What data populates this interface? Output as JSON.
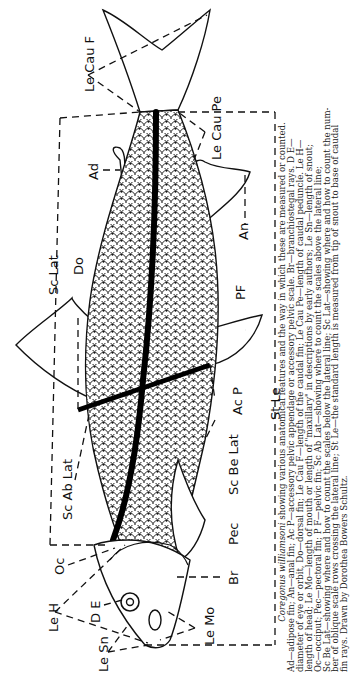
{
  "figure": {
    "subject": "Coregonus williamsoni",
    "orientation": "rotated 90° counter-clockwise (head at bottom, tail at top)",
    "labels": {
      "le_cau_f": "Le Cau F",
      "le_cau_pe": "Le Cau Pe",
      "ad": "Ad",
      "an": "An",
      "sc_lat": "Sc Lat",
      "do": "Do",
      "pf": "PF",
      "st_le": "St Le",
      "ac_p": "Ac P",
      "sc_ab_lat": "Sc Ab Lat",
      "sc_be_lat": "Sc Be Lat",
      "pec": "Pec",
      "oc": "Oc",
      "br": "Br",
      "le_h": "Le H",
      "de": "D E",
      "le_mo": "Le Mo",
      "le_sn": "Le Sn"
    },
    "colors": {
      "ink": "#111111",
      "background": "#ffffff",
      "caption_text": "#222222"
    }
  },
  "caption": {
    "species": "Coregonus williamsoni",
    "lead": " showing various anatomical features and the way in which these are measured or counted.",
    "lines": [
      "Ad—adipose fin; An—anal fin; Ac P—accessory pelvic appendage or accessory pelvic scale. Br—branchiostegal rays. D E—",
      "diameter of eye or orbit, Do—dorsal fin; Le Cau F—length of the caudal fin; Le Cau Pe—length of caudal peduncle. Le H—",
      "length of head; Le Mo—length of mouth or length of \"maxillary\" in descriptions by early authors; Le Sn—length of snout;",
      "Oc—occiput; Pec—pectoral fin; P F—pelvic fin; Sc Ab Lat—showing where to count the scales above the lateral line;",
      "Sc Be Lat—showing where and how to count the scales below the lateral line; Sc Lat—showing where and how to count the num-",
      "ber of oblique scale rows crossing the lateral line; St Le—the standard length is measured from tip of snout to base of caudal",
      "fin rays. Drawn by Dorothea Bowers Schultz."
    ]
  }
}
